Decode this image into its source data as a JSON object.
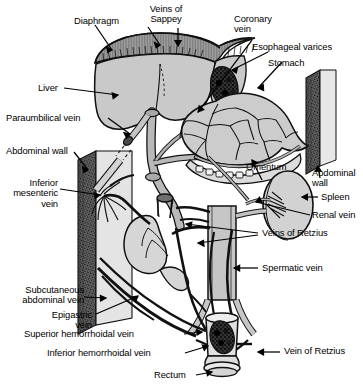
{
  "figure": {
    "type": "anatomical-diagram",
    "palette": {
      "outline": "#1a1a1a",
      "organ_fill": "#c9c9c9",
      "organ_fill_light": "#dcdcdc",
      "vessel_fill": "#b9b9b9",
      "dark_plexus": "#2b2b2b",
      "wall_edge": "#3a3a3a",
      "background": "#ffffff"
    }
  },
  "labels": {
    "diaphragm": "Diaphragm",
    "veins_of_sappey": "Veins of\nSappey",
    "coronary_vein": "Coronary\nvein",
    "esophageal_varices": "Esophageal varices",
    "stomach": "Stomach",
    "liver": "Liver",
    "paraumbilical_vein": "Paraumbilical vein",
    "abdominal_wall_left": "Abdominal wall",
    "inferior_mesenteric_vein": "Inferior\nmesenteric\nvein",
    "omentum": "Omentum",
    "abdominal_wall_right": "Abdominal\nwall",
    "spleen": "Spleen",
    "renal_vein": "Renal vein",
    "veins_of_retzius": "Veins of Retzius",
    "spermatic_vein": "Spermatic vein",
    "subcutaneous_abdominal_vein": "Subcutaneous\nabdominal vein",
    "epigastric_vein": "Epigastric\nvein",
    "superior_hemorrhoidal_vein": "Superior hemorrhoidal vein",
    "inferior_hemorrhoidal_vein": "Inferior hemorrhoidal vein",
    "vein_of_retzius": "Vein of Retzius",
    "rectum": "Rectum"
  },
  "structures": [
    {
      "name": "diaphragm",
      "kind": "membrane"
    },
    {
      "name": "liver",
      "kind": "organ"
    },
    {
      "name": "stomach",
      "kind": "organ"
    },
    {
      "name": "spleen",
      "kind": "organ"
    },
    {
      "name": "kidney",
      "kind": "organ"
    },
    {
      "name": "rectum",
      "kind": "organ"
    },
    {
      "name": "omentum",
      "kind": "membrane"
    },
    {
      "name": "abdominal-wall",
      "kind": "body-wall"
    },
    {
      "name": "portal-vein",
      "kind": "vessel"
    },
    {
      "name": "inferior-vena-cava",
      "kind": "vessel"
    },
    {
      "name": "coronary-vein",
      "kind": "vessel"
    },
    {
      "name": "esophageal-varices",
      "kind": "vessel-plexus"
    },
    {
      "name": "paraumbilical-vein",
      "kind": "vessel"
    },
    {
      "name": "veins-of-sappey",
      "kind": "vessel-plexus"
    },
    {
      "name": "veins-of-retzius",
      "kind": "vessel"
    },
    {
      "name": "spermatic-vein",
      "kind": "vessel"
    },
    {
      "name": "renal-vein",
      "kind": "vessel"
    },
    {
      "name": "inferior-mesenteric-vein",
      "kind": "vessel"
    },
    {
      "name": "superior-hemorrhoidal-vein",
      "kind": "vessel"
    },
    {
      "name": "inferior-hemorrhoidal-vein",
      "kind": "vessel"
    },
    {
      "name": "epigastric-vein",
      "kind": "vessel"
    },
    {
      "name": "subcutaneous-abdominal-vein",
      "kind": "vessel"
    },
    {
      "name": "hemorrhoidal-plexus",
      "kind": "vessel-plexus"
    }
  ]
}
